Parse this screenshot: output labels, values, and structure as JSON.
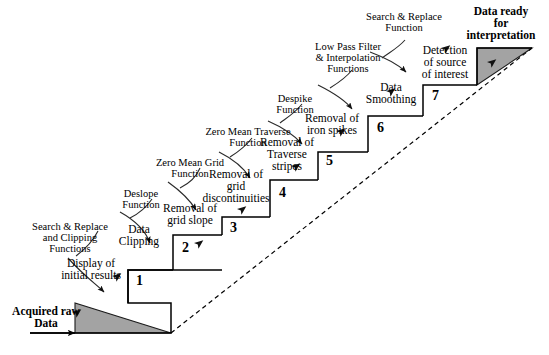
{
  "figure": {
    "title_hidden": "",
    "input_label": "Acquired raw\nData",
    "output_label": "Data ready\nfor\ninterpretation",
    "shade_color": "#a0a0a0",
    "line_color": "#000000"
  },
  "steps": [
    {
      "number": "1",
      "label": "Display of\ninitial results"
    },
    {
      "number": "2",
      "label": "Data\nClipping"
    },
    {
      "number": "3",
      "label": "Removal of\ngrid slope"
    },
    {
      "number": "4",
      "label": "Removal of\ngrid\ndiscontinuities"
    },
    {
      "number": "5",
      "label": "Removal of\nTraverse\nstripes"
    },
    {
      "number": "6",
      "label": "Removal of\niron spikes"
    },
    {
      "number": "7",
      "label": "Data\nSmoothing"
    },
    {
      "number": "8",
      "label": "Detection\nof source\nof interest"
    }
  ],
  "functions": [
    {
      "id": "f1",
      "label": "Search & Replace\nand Clipping\nFunctions"
    },
    {
      "id": "f2",
      "label": "Deslope\nFunction"
    },
    {
      "id": "f3",
      "label": "Zero Mean Grid\nFunction"
    },
    {
      "id": "f4",
      "label": "Zero Mean Traverse\nFunction"
    },
    {
      "id": "f5",
      "label": "Despike\nFunction"
    },
    {
      "id": "f6",
      "label": "Low Pass Filter\n& Interpolation\nFunctions"
    },
    {
      "id": "f7",
      "label": "Search & Replace\nFunction"
    }
  ]
}
